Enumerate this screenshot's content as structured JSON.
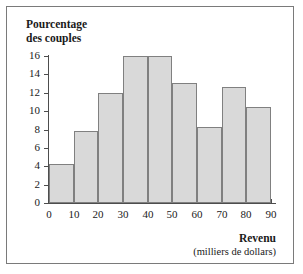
{
  "chart_data": {
    "type": "bar",
    "title": "",
    "ylabel": "Pourcentage\ndes couples",
    "xlabel": "Revenu",
    "xlabel_units": "(milliers de dollars)",
    "categories": [
      "0-10",
      "10-20",
      "20-30",
      "30-40",
      "40-50",
      "50-60",
      "60-70",
      "70-80",
      "80-90"
    ],
    "bin_edges": [
      0,
      10,
      20,
      30,
      40,
      50,
      60,
      70,
      80,
      90
    ],
    "values": [
      4.3,
      7.8,
      12.0,
      16.0,
      16.0,
      13.1,
      8.3,
      12.6,
      10.5
    ],
    "xlim": [
      0,
      90
    ],
    "ylim": [
      0,
      16
    ],
    "xticks": [
      0,
      10,
      20,
      30,
      40,
      50,
      60,
      70,
      80,
      90
    ],
    "yticks": [
      0,
      2,
      4,
      6,
      8,
      10,
      12,
      14,
      16
    ],
    "xtick_labels": [
      "0",
      "10",
      "20",
      "30",
      "40",
      "50",
      "60",
      "70",
      "80",
      "90"
    ],
    "ytick_labels": [
      "0",
      "2",
      "4",
      "6",
      "8",
      "10",
      "12",
      "14",
      "16"
    ],
    "grid": false,
    "legend": null,
    "bar_fill_color": "#d9d9d9",
    "bar_edge_color": "#808080",
    "axis_color": "#4d4d4d",
    "background_color": "#ffffff"
  }
}
